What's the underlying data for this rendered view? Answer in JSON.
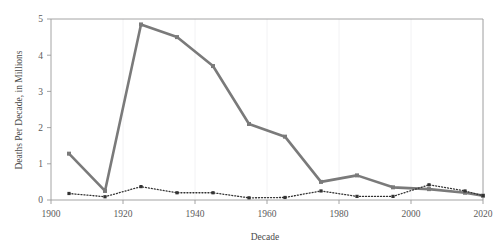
{
  "chart_data": {
    "type": "line",
    "title": "",
    "xlabel": "Decade",
    "ylabel": "Deaths Per Decade, in Millions",
    "xlim": [
      1900,
      2020
    ],
    "ylim": [
      0,
      5
    ],
    "xticks": [
      1900,
      1920,
      1940,
      1960,
      1980,
      2000,
      2020
    ],
    "xticklabels": [
      "1900",
      "1920",
      "1940",
      "1960",
      "1980",
      "2000",
      "2020"
    ],
    "yticks": [
      0,
      1,
      2,
      3,
      4,
      5
    ],
    "yticklabels": [
      "0",
      "1",
      "2",
      "3",
      "4",
      "5"
    ],
    "grid": "vertical-only",
    "legend": "none",
    "series": [
      {
        "name": "solid-series",
        "style": "solid",
        "color": "#7a7a7a",
        "marker": "square",
        "x": [
          1905,
          1915,
          1925,
          1935,
          1945,
          1955,
          1965,
          1975,
          1985,
          1995,
          2005,
          2015,
          2020
        ],
        "values": [
          1.28,
          0.25,
          4.85,
          4.5,
          3.7,
          2.1,
          1.75,
          0.5,
          0.68,
          0.35,
          0.3,
          0.2,
          0.12
        ]
      },
      {
        "name": "dotted-series",
        "style": "dotted",
        "color": "#333333",
        "marker": "square",
        "x": [
          1905,
          1915,
          1925,
          1935,
          1945,
          1955,
          1965,
          1975,
          1985,
          1995,
          2005,
          2015,
          2020
        ],
        "values": [
          0.18,
          0.09,
          0.37,
          0.2,
          0.2,
          0.06,
          0.07,
          0.25,
          0.1,
          0.1,
          0.42,
          0.25,
          0.12
        ]
      }
    ]
  },
  "axes": {
    "x_title": "Decade",
    "y_title": "Deaths Per Decade, in Millions"
  }
}
